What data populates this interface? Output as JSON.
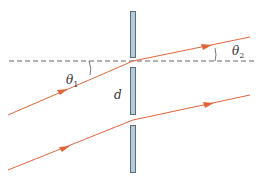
{
  "diagram": {
    "type": "double-slit refraction diagram",
    "labels": {
      "theta1": "θ",
      "theta1_sub": "1",
      "theta2": "θ",
      "theta2_sub": "2",
      "slit_separation": "d"
    },
    "colors": {
      "ray": "#e0663a",
      "plate_fill": "#b3cbd8",
      "plate_stroke": "#5a6e7a",
      "dashed_line": "#666666",
      "angle_arc": "#555555"
    },
    "elements": {
      "normal_line": "horizontal dashed reference line",
      "plates": [
        "top barrier",
        "middle barrier",
        "bottom barrier"
      ],
      "rays": [
        "upper ray through slit 1",
        "lower ray through slit 2"
      ]
    }
  }
}
